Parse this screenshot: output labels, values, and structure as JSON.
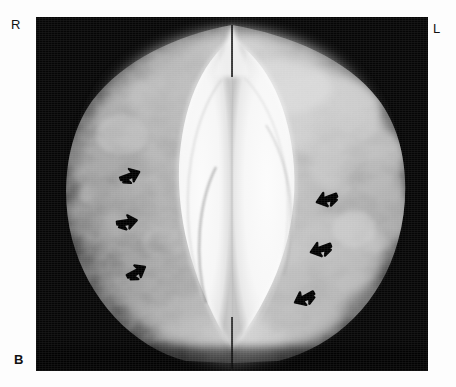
{
  "figure": {
    "panel_letter": "B",
    "modality": "mammogram",
    "view": "bilateral craniocaudal composite",
    "background_color": "#ffffff",
    "film_color": "#050505"
  },
  "annotations": {
    "right_marker": "R",
    "left_marker": "L"
  },
  "plate": {
    "x": 36,
    "y": 17,
    "width": 392,
    "height": 354
  },
  "arrows": [
    {
      "id": "arrow-r1",
      "side": "right",
      "x": 118,
      "y": 172,
      "rotation": -20,
      "size": 20,
      "label": "capsular-contracture-marker"
    },
    {
      "id": "arrow-r2",
      "side": "right",
      "x": 116,
      "y": 216,
      "rotation": -8,
      "size": 20,
      "label": "capsular-contracture-marker"
    },
    {
      "id": "arrow-r3",
      "side": "right",
      "x": 124,
      "y": 270,
      "rotation": -28,
      "size": 20,
      "label": "capsular-contracture-marker"
    },
    {
      "id": "arrow-l1",
      "side": "left",
      "x": 334,
      "y": 188,
      "rotation": 20,
      "size": 21,
      "label": "capsular-contracture-marker"
    },
    {
      "id": "arrow-l2",
      "side": "left",
      "x": 328,
      "y": 238,
      "rotation": 20,
      "size": 21,
      "label": "capsular-contracture-marker"
    },
    {
      "id": "arrow-l3",
      "side": "left",
      "x": 310,
      "y": 286,
      "rotation": 28,
      "size": 21,
      "label": "capsular-contracture-marker"
    }
  ],
  "structures": [
    {
      "name": "right-implant",
      "description": "radiodense oval implant silhouette, right breast"
    },
    {
      "name": "left-implant",
      "description": "radiodense oval implant silhouette, left breast"
    },
    {
      "name": "right-fibroglandular-tissue",
      "description": "mid-grey mottled parenchyma lateral to right implant"
    },
    {
      "name": "left-fibroglandular-tissue",
      "description": "mid-grey parenchyma lateral to left implant"
    },
    {
      "name": "cleavage-line",
      "description": "thin vertical midline separation between the two breasts"
    }
  ]
}
